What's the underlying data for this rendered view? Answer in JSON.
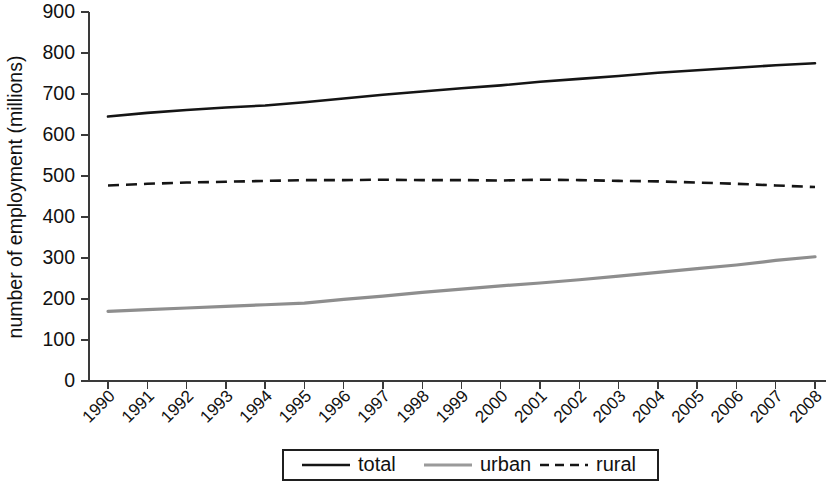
{
  "chart_data": {
    "type": "line",
    "title": "",
    "xlabel": "",
    "ylabel": "number of employment (millions)",
    "xlim": [
      1990,
      2008
    ],
    "ylim": [
      0,
      900
    ],
    "ytick_step": 100,
    "grid": false,
    "legend_position": "bottom",
    "categories": [
      "1990",
      "1991",
      "1992",
      "1993",
      "1994",
      "1995",
      "1996",
      "1997",
      "1998",
      "1999",
      "2000",
      "2001",
      "2002",
      "2003",
      "2004",
      "2005",
      "2006",
      "2007",
      "2008"
    ],
    "yticks": [
      "0",
      "100",
      "200",
      "300",
      "400",
      "500",
      "600",
      "700",
      "800",
      "900"
    ],
    "series": [
      {
        "name": "total",
        "style": "solid",
        "color": "#151515",
        "values": [
          645,
          654,
          661,
          667,
          672,
          680,
          689,
          698,
          706,
          714,
          721,
          730,
          737,
          744,
          752,
          758,
          764,
          770,
          775
        ]
      },
      {
        "name": "urban",
        "style": "solid",
        "color": "#8e8e8e",
        "values": [
          170,
          174,
          178,
          182,
          186,
          190,
          199,
          207,
          216,
          224,
          232,
          239,
          247,
          256,
          265,
          274,
          283,
          294,
          303
        ]
      },
      {
        "name": "rural",
        "style": "dashed",
        "color": "#151515",
        "values": [
          477,
          481,
          484,
          486,
          488,
          490,
          490,
          491,
          490,
          490,
          489,
          491,
          490,
          488,
          487,
          484,
          481,
          477,
          473
        ]
      }
    ]
  },
  "legend": {
    "items": [
      {
        "label": "total",
        "style": "solid",
        "color": "#151515"
      },
      {
        "label": "urban",
        "style": "solid",
        "color": "#9a9a9a"
      },
      {
        "label": "rural",
        "style": "dashed",
        "color": "#151515"
      }
    ]
  }
}
